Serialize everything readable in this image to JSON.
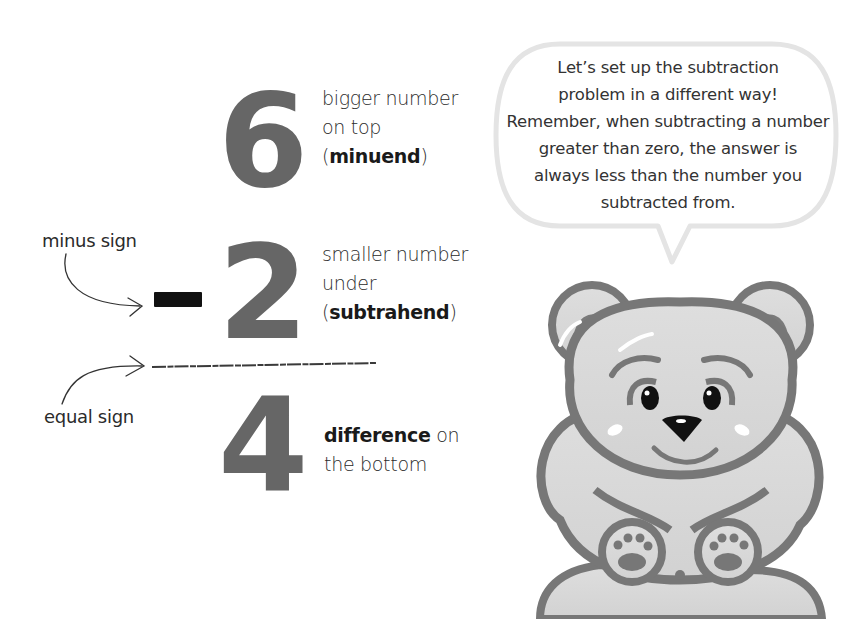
{
  "problem": {
    "minuend": "6",
    "subtrahend": "2",
    "difference": "4",
    "operator": "-"
  },
  "labels": {
    "minuend": {
      "line1": "bigger number",
      "line2": "on top",
      "paren_open": "(",
      "term": "minuend",
      "paren_close": ")"
    },
    "subtrahend": {
      "line1": "smaller number",
      "line2": "under",
      "paren_open": "(",
      "term": "subtrahend",
      "paren_close": ")"
    },
    "difference": {
      "term": "difference",
      "line1_rest": " on",
      "line2": "the bottom"
    }
  },
  "annotations": {
    "minus_sign": "minus sign",
    "equal_sign": "equal sign"
  },
  "speech_bubble": {
    "lines": [
      "Let’s set up the subtraction",
      "problem in a different way!",
      "Remember, when subtracting a number",
      "greater than zero, the answer is",
      "always less than the number you",
      "subtracted from."
    ]
  },
  "colors": {
    "numeral": "#666666",
    "minus_bar": "#111111",
    "bear_fill": "#d9d9d9",
    "bear_outline": "#777777",
    "bubble_border": "#e4e4e4"
  }
}
